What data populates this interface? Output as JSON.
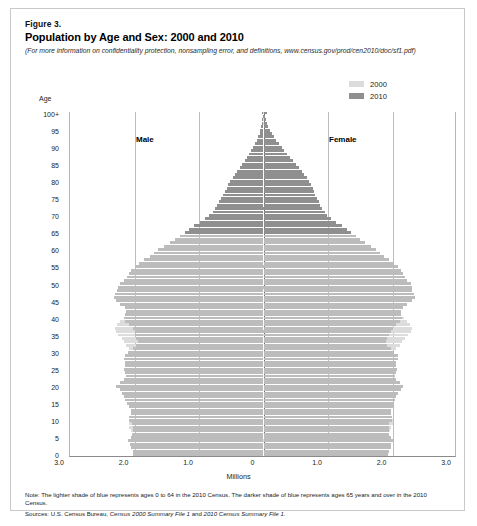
{
  "figure": {
    "number": "Figure 3.",
    "title": "Population by Age and Sex: 2000 and 2010",
    "subnote": "(For more information on confidentiality protection, nonsampling error, and definitions, www.census.gov/prod/cen2010/doc/sf1.pdf)"
  },
  "legend": {
    "items": [
      {
        "label": "2000",
        "color": "#dcdcdc"
      },
      {
        "label": "2010",
        "color": "#8f8f8f"
      }
    ]
  },
  "labels": {
    "age_axis": "Age",
    "male": "Male",
    "female": "Female",
    "x_axis_title": "Millions"
  },
  "footer": {
    "note": "Note: The lighter shade of blue represents ages 0 to 64 in the 2010 Census. The darker shade of blue represents ages 65 years and over in the 2010 Census.",
    "sources_prefix": "Sources: U.S. Census Bureau, ",
    "sources_italic1": "Census 2000 Summary File 1",
    "sources_mid": " and ",
    "sources_italic2": "2010 Census Summary File 1",
    "sources_suffix": "."
  },
  "chart_data": {
    "type": "bar",
    "subtype": "population-pyramid",
    "title": "Population by Age and Sex: 2000 and 2010",
    "xlabel": "Millions",
    "ylabel": "Age",
    "xlim": [
      -3.0,
      3.0
    ],
    "xticks": [
      -3.0,
      -2.0,
      -1.0,
      0,
      1.0,
      2.0,
      3.0
    ],
    "xticklabels": [
      "3.0",
      "2.0",
      "1.0",
      "0",
      "1.0",
      "2.0",
      "3.0"
    ],
    "ylim": [
      0,
      100
    ],
    "yticks": [
      0,
      5,
      10,
      15,
      20,
      25,
      30,
      35,
      40,
      45,
      50,
      55,
      60,
      65,
      70,
      75,
      80,
      85,
      90,
      95,
      100
    ],
    "yticklabels": [
      "0",
      "5",
      "10",
      "15",
      "20",
      "25",
      "30",
      "35",
      "40",
      "45",
      "50",
      "55",
      "60",
      "65",
      "70",
      "75",
      "80",
      "85",
      "90",
      "95",
      "100+"
    ],
    "grid": "vertical",
    "legend_position": "top-right",
    "dark_shade_age_threshold": 65,
    "ages": [
      0,
      1,
      2,
      3,
      4,
      5,
      6,
      7,
      8,
      9,
      10,
      11,
      12,
      13,
      14,
      15,
      16,
      17,
      18,
      19,
      20,
      21,
      22,
      23,
      24,
      25,
      26,
      27,
      28,
      29,
      30,
      31,
      32,
      33,
      34,
      35,
      36,
      37,
      38,
      39,
      40,
      41,
      42,
      43,
      44,
      45,
      46,
      47,
      48,
      49,
      50,
      51,
      52,
      53,
      54,
      55,
      56,
      57,
      58,
      59,
      60,
      61,
      62,
      63,
      64,
      65,
      66,
      67,
      68,
      69,
      70,
      71,
      72,
      73,
      74,
      75,
      76,
      77,
      78,
      79,
      80,
      81,
      82,
      83,
      84,
      85,
      86,
      87,
      88,
      89,
      90,
      91,
      92,
      93,
      94,
      95,
      96,
      97,
      98,
      99,
      100
    ],
    "series": [
      {
        "name": "2000",
        "sex": "male",
        "units": "millions",
        "values": [
          1.96,
          1.96,
          1.97,
          1.99,
          2.0,
          2.01,
          2.03,
          2.05,
          2.08,
          2.09,
          2.09,
          2.07,
          2.05,
          2.04,
          2.03,
          2.03,
          2.04,
          2.04,
          2.05,
          2.04,
          1.96,
          1.87,
          1.81,
          1.78,
          1.79,
          1.81,
          1.82,
          1.84,
          1.88,
          1.95,
          2.03,
          2.09,
          2.13,
          2.16,
          2.2,
          2.25,
          2.29,
          2.3,
          2.27,
          2.22,
          2.17,
          2.11,
          2.05,
          1.99,
          1.93,
          1.88,
          1.82,
          1.76,
          1.7,
          1.64,
          1.58,
          1.51,
          1.44,
          1.37,
          1.29,
          1.21,
          1.14,
          1.08,
          1.03,
          0.99,
          0.95,
          0.9,
          0.86,
          0.83,
          0.8,
          0.78,
          0.76,
          0.74,
          0.72,
          0.7,
          0.68,
          0.66,
          0.63,
          0.61,
          0.58,
          0.55,
          0.52,
          0.49,
          0.46,
          0.43,
          0.4,
          0.36,
          0.33,
          0.3,
          0.27,
          0.24,
          0.21,
          0.18,
          0.15,
          0.13,
          0.1,
          0.08,
          0.06,
          0.05,
          0.04,
          0.03,
          0.02,
          0.015,
          0.01,
          0.007,
          0.012
        ]
      },
      {
        "name": "2000",
        "sex": "female",
        "units": "millions",
        "values": [
          1.87,
          1.87,
          1.88,
          1.9,
          1.91,
          1.92,
          1.94,
          1.96,
          1.98,
          2.0,
          2.0,
          1.98,
          1.96,
          1.95,
          1.94,
          1.93,
          1.94,
          1.94,
          1.96,
          1.97,
          1.9,
          1.81,
          1.76,
          1.73,
          1.74,
          1.76,
          1.78,
          1.81,
          1.85,
          1.92,
          2.0,
          2.06,
          2.11,
          2.15,
          2.19,
          2.24,
          2.28,
          2.3,
          2.27,
          2.23,
          2.18,
          2.13,
          2.07,
          2.02,
          1.96,
          1.91,
          1.86,
          1.8,
          1.75,
          1.69,
          1.63,
          1.56,
          1.5,
          1.43,
          1.36,
          1.28,
          1.21,
          1.16,
          1.11,
          1.07,
          1.04,
          1.0,
          0.96,
          0.93,
          0.91,
          0.9,
          0.89,
          0.88,
          0.87,
          0.86,
          0.85,
          0.84,
          0.82,
          0.8,
          0.78,
          0.75,
          0.72,
          0.7,
          0.67,
          0.64,
          0.61,
          0.57,
          0.53,
          0.49,
          0.45,
          0.41,
          0.37,
          0.33,
          0.29,
          0.25,
          0.21,
          0.17,
          0.14,
          0.11,
          0.09,
          0.07,
          0.05,
          0.035,
          0.025,
          0.018,
          0.035
        ]
      },
      {
        "name": "2010",
        "sex": "male",
        "units": "millions",
        "values": [
          2.02,
          2.03,
          2.06,
          2.07,
          2.1,
          2.06,
          2.04,
          2.03,
          2.02,
          2.04,
          2.08,
          2.08,
          2.06,
          2.06,
          2.09,
          2.12,
          2.14,
          2.16,
          2.19,
          2.23,
          2.28,
          2.23,
          2.16,
          2.13,
          2.14,
          2.16,
          2.15,
          2.14,
          2.16,
          2.15,
          2.1,
          2.03,
          1.97,
          1.95,
          1.97,
          1.99,
          2.0,
          2.03,
          2.09,
          2.14,
          2.16,
          2.14,
          2.13,
          2.15,
          2.22,
          2.29,
          2.32,
          2.3,
          2.27,
          2.25,
          2.22,
          2.17,
          2.12,
          2.08,
          2.05,
          2.0,
          1.93,
          1.85,
          1.76,
          1.69,
          1.63,
          1.54,
          1.45,
          1.37,
          1.3,
          1.22,
          1.15,
          1.07,
          0.98,
          0.9,
          0.84,
          0.79,
          0.75,
          0.72,
          0.69,
          0.66,
          0.63,
          0.6,
          0.57,
          0.55,
          0.52,
          0.48,
          0.44,
          0.41,
          0.37,
          0.33,
          0.29,
          0.26,
          0.22,
          0.19,
          0.16,
          0.13,
          0.1,
          0.08,
          0.06,
          0.05,
          0.035,
          0.025,
          0.018,
          0.012,
          0.02
        ]
      },
      {
        "name": "2010",
        "sex": "female",
        "units": "millions",
        "values": [
          1.93,
          1.95,
          1.97,
          1.98,
          2.01,
          1.97,
          1.95,
          1.94,
          1.94,
          1.95,
          1.99,
          1.99,
          1.97,
          1.97,
          2.0,
          2.02,
          2.04,
          2.06,
          2.09,
          2.13,
          2.17,
          2.12,
          2.06,
          2.04,
          2.05,
          2.07,
          2.06,
          2.06,
          2.08,
          2.08,
          2.03,
          1.97,
          1.92,
          1.9,
          1.92,
          1.95,
          1.97,
          2.0,
          2.06,
          2.12,
          2.15,
          2.13,
          2.13,
          2.16,
          2.23,
          2.31,
          2.35,
          2.34,
          2.31,
          2.3,
          2.28,
          2.23,
          2.19,
          2.16,
          2.13,
          2.09,
          2.03,
          1.95,
          1.87,
          1.8,
          1.75,
          1.66,
          1.58,
          1.5,
          1.43,
          1.36,
          1.29,
          1.21,
          1.13,
          1.05,
          0.99,
          0.95,
          0.91,
          0.88,
          0.86,
          0.83,
          0.8,
          0.78,
          0.76,
          0.74,
          0.71,
          0.67,
          0.63,
          0.59,
          0.55,
          0.5,
          0.46,
          0.41,
          0.37,
          0.32,
          0.28,
          0.24,
          0.2,
          0.16,
          0.13,
          0.1,
          0.075,
          0.055,
          0.04,
          0.028,
          0.055
        ]
      }
    ]
  }
}
